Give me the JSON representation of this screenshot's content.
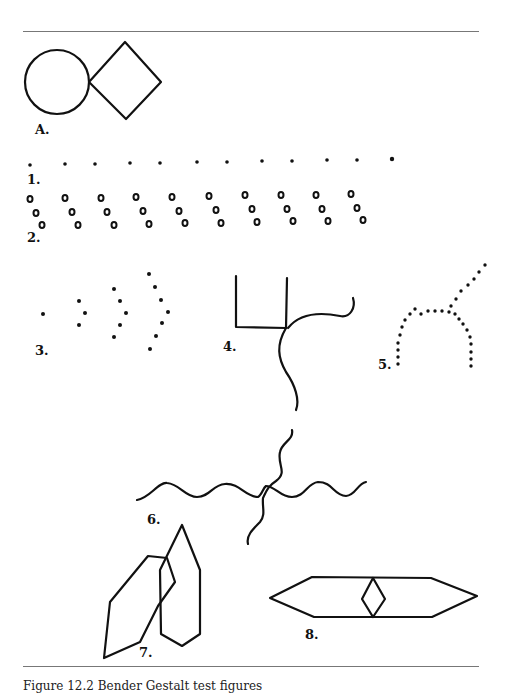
{
  "figure": {
    "labels": {
      "A": "A.",
      "f1": "1.",
      "f2": "2.",
      "f3": "3.",
      "f4": "4.",
      "f5": "5.",
      "f6": "6.",
      "f7": "7.",
      "f8": "8."
    },
    "caption": "Figure 12.2 Bender Gestalt test figures"
  },
  "colors": {
    "ink": "#111111",
    "rule": "#777777",
    "background": "#ffffff"
  }
}
